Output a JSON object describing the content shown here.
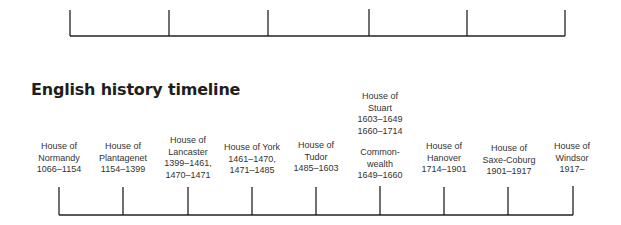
{
  "title": "English history timeline",
  "colors": {
    "axis": "#222222",
    "text": "#333333",
    "title": "#1e1e1e",
    "background": "#ffffff"
  },
  "top_timeline": {
    "tick_x": [
      70,
      169,
      268,
      369,
      467,
      565
    ],
    "baseline_y": 36,
    "tick_top_y": 10
  },
  "bottom_timeline": {
    "tick_x": [
      59,
      123,
      188,
      252,
      316,
      380,
      444,
      508,
      573
    ],
    "baseline_y": 215,
    "tick_top_y": 187
  },
  "houses": [
    {
      "name_line1": "House of",
      "name_line2": "Normandy",
      "dates": [
        "1066–1154"
      ]
    },
    {
      "name_line1": "House of",
      "name_line2": "Plantagenet",
      "dates": [
        "1154–1399"
      ]
    },
    {
      "name_line1": "House of",
      "name_line2": "Lancaster",
      "dates": [
        "1399–1461,",
        "1470–1471"
      ]
    },
    {
      "name_line1": "House of York",
      "name_line2": "",
      "dates": [
        "1461–1470,",
        "1471–1485"
      ]
    },
    {
      "name_line1": "House of",
      "name_line2": "Tudor",
      "dates": [
        "1485–1603"
      ]
    },
    {
      "name_line1": "House of",
      "name_line2": "Stuart",
      "dates": [
        "1603–1649",
        "1660–1714"
      ],
      "interregnum": {
        "line1": "Common-",
        "line2": "wealth",
        "dates": "1649–1660"
      }
    },
    {
      "name_line1": "House of",
      "name_line2": "Hanover",
      "dates": [
        "1714–1901"
      ]
    },
    {
      "name_line1": "House of",
      "name_line2": "Saxe-Coburg",
      "dates": [
        "1901–1917"
      ]
    },
    {
      "name_line1": "House of",
      "name_line2": "Windsor",
      "dates": [
        "1917–"
      ]
    }
  ]
}
